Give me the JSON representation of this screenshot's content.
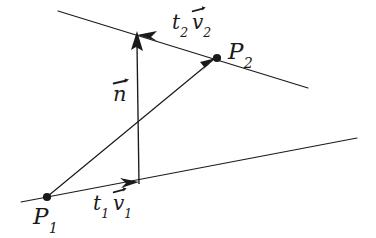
{
  "figure": {
    "type": "geometry-diagram",
    "canvas": {
      "width": 376,
      "height": 238,
      "background": "#ffffff"
    },
    "stroke_color": "#1a1a1a",
    "text_color": "#1a1a1a",
    "labels": {
      "p1": {
        "base": "P",
        "sub": "1"
      },
      "p2": {
        "base": "P",
        "sub": "2"
      },
      "n": {
        "base": "n"
      },
      "t1v1": {
        "t": "t",
        "t_sub": "1",
        "v": "v",
        "v_sub": "1"
      },
      "t2v2": {
        "t": "t",
        "t_sub": "2",
        "v": "v",
        "v_sub": "2"
      }
    },
    "points": [
      {
        "name": "P1",
        "x": 47,
        "y": 197
      },
      {
        "name": "P2",
        "x": 217,
        "y": 58
      }
    ],
    "lines": [
      {
        "name": "line-2-upper",
        "x1": 58,
        "y1": 11,
        "x2": 308,
        "y2": 88
      },
      {
        "name": "line-1-lower",
        "x1": 21,
        "y1": 202,
        "x2": 357,
        "y2": 138
      }
    ],
    "vectors": [
      {
        "name": "n",
        "x1": 139,
        "y1": 183,
        "x2": 137,
        "y2": 33,
        "label": "n"
      },
      {
        "name": "t1v1",
        "x1": 50,
        "y1": 196,
        "x2": 138,
        "y2": 182,
        "label": "t1 v1"
      },
      {
        "name": "t2v2",
        "x1": 215,
        "y1": 57,
        "x2": 139,
        "y2": 34,
        "label": "t2 v2"
      },
      {
        "name": "p1-to-p2",
        "x1": 48,
        "y1": 196,
        "x2": 216,
        "y2": 58,
        "label": ""
      }
    ]
  }
}
